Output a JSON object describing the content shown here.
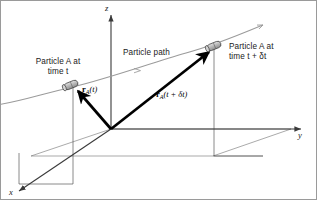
{
  "figure": {
    "background_color": "#ffffff",
    "border_color": "#9a9a9a"
  },
  "axes": {
    "z_label": "z",
    "y_label": "y",
    "x_label": "x",
    "origin_label": "",
    "color": "#3a3a3a"
  },
  "path": {
    "label": "Particle path",
    "color": "#9b9b9b"
  },
  "particles": [
    {
      "id": "particle-a-t",
      "label_line1": "Particle A at",
      "label_line2": "time t",
      "body_color": "#b9b9b9",
      "outline_color": "#3a3a3a"
    },
    {
      "id": "particle-a-t-plus-dt",
      "label_line1": "Particle A at",
      "label_line2": "time t + δt",
      "body_color": "#b9b9b9",
      "outline_color": "#3a3a3a"
    }
  ],
  "vectors": [
    {
      "id": "vector-r-a-t",
      "symbol": "r",
      "subscript": "A",
      "argument": "(t)",
      "color": "#000000"
    },
    {
      "id": "vector-r-a-t-plus-dt",
      "symbol": "r",
      "subscript": "A",
      "argument": "(t + δt)",
      "color": "#000000"
    }
  ],
  "construction_lines": {
    "color": "#6e6e6e",
    "description": "ground plane parallelogram and vertical projection drop lines"
  }
}
